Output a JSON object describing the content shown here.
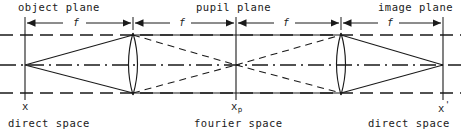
{
  "figure": {
    "width": 461,
    "height": 133,
    "background_color": "#ffffff",
    "line_color": "#1a1a1a",
    "text_color": "#1a1a1a"
  },
  "top_labels": [
    {
      "name": "object-plane",
      "text": "object plane",
      "x": 18
    },
    {
      "name": "pupil-plane",
      "text": "pupil plane",
      "x": 196
    },
    {
      "name": "image-plane",
      "text": "image plane",
      "x": 378
    }
  ],
  "dimensions": {
    "label": "f",
    "segments": [
      {
        "from": 25,
        "to": 133,
        "label": "f",
        "label_x": 73
      },
      {
        "from": 133,
        "to": 236,
        "label": "f",
        "label_x": 179
      },
      {
        "from": 236,
        "to": 341,
        "label": "f",
        "label_x": 283
      },
      {
        "from": 341,
        "to": 443,
        "label": "f",
        "label_x": 387
      }
    ],
    "y": 23
  },
  "coord_labels": [
    {
      "name": "x",
      "base": "x",
      "sub": "",
      "prime": "",
      "x": 22
    },
    {
      "name": "x-pupil",
      "base": "x",
      "sub": "p",
      "prime": "",
      "x": 231
    },
    {
      "name": "x-prime",
      "base": "x",
      "sub": "",
      "prime": "'",
      "x": 438
    }
  ],
  "space_labels": [
    {
      "name": "direct-space-object",
      "text": "direct space",
      "x": 8
    },
    {
      "name": "fourier-space",
      "text": "fourier space",
      "x": 194
    },
    {
      "name": "direct-space-image",
      "text": "direct space",
      "x": 368
    }
  ],
  "planes": [
    {
      "name": "object-plane-line",
      "x": 25,
      "top": 17,
      "bottom": 100
    },
    {
      "name": "pupil-plane-line",
      "x": 236,
      "top": 17,
      "bottom": 100
    },
    {
      "name": "image-plane-line",
      "x": 443,
      "top": 17,
      "bottom": 100
    }
  ],
  "lenses": [
    {
      "name": "lens-1",
      "x": 133,
      "top": 33,
      "bottom": 95,
      "bulge": 9
    },
    {
      "name": "lens-2",
      "x": 341,
      "top": 33,
      "bottom": 95,
      "bulge": 9
    }
  ],
  "axes": [
    {
      "name": "upper-dashed-axis",
      "y": 35,
      "style": "dashed"
    },
    {
      "name": "optical-axis",
      "y": 65,
      "style": "dashdot"
    },
    {
      "name": "lower-dashed-axis",
      "y": 93,
      "style": "dashed"
    }
  ],
  "ray_bundles": [
    {
      "name": "solid-rays",
      "style": "solid",
      "description": "rays from on-axis object point through both lenses to image point"
    },
    {
      "name": "dashed-rays",
      "style": "dashed",
      "description": "conjugate rays crossing at the pupil plane"
    }
  ]
}
